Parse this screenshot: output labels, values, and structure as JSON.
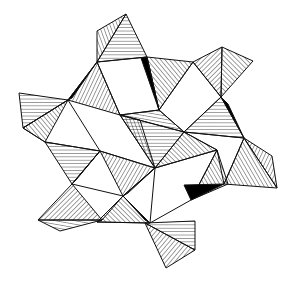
{
  "diagram": {
    "type": "polyhedral-structure",
    "description": "Ring of hatched tetrahedra linked by corners around open square gaps",
    "colors": {
      "line": "#111111",
      "background": "#ffffff",
      "shadow": "#000000"
    },
    "polyhedra": [
      {
        "id": "t1",
        "faces": [
          {
            "pts": [
              [
                126,
                14
              ],
              [
                97,
                31
              ],
              [
                97,
                62
              ]
            ],
            "hatch": 70
          },
          {
            "pts": [
              [
                126,
                14
              ],
              [
                97,
                62
              ],
              [
                147,
                57
              ]
            ],
            "hatch": 0
          }
        ]
      },
      {
        "id": "t2",
        "faces": [
          {
            "pts": [
              [
                222,
                47
              ],
              [
                193,
                62
              ],
              [
                221,
                97
              ]
            ],
            "hatch": 135
          },
          {
            "pts": [
              [
                222,
                47
              ],
              [
                253,
                61
              ],
              [
                221,
                97
              ]
            ],
            "hatch": 45
          }
        ]
      },
      {
        "id": "t3",
        "faces": [
          {
            "pts": [
              [
                141,
                58
              ],
              [
                147,
                57
              ],
              [
                159,
                110
              ]
            ],
            "hatch": 0,
            "fill": "#000"
          },
          {
            "pts": [
              [
                147,
                57
              ],
              [
                193,
                62
              ],
              [
                159,
                110
              ]
            ],
            "hatch": 50
          }
        ]
      },
      {
        "id": "t4",
        "faces": [
          {
            "pts": [
              [
                97,
                62
              ],
              [
                68,
                100
              ],
              [
                120,
                115
              ]
            ],
            "hatch": 115
          },
          {
            "pts": [
              [
                97,
                62
              ],
              [
                72,
                98
              ],
              [
                68,
                100
              ]
            ],
            "hatch": 0,
            "fill": "#000"
          }
        ]
      },
      {
        "id": "t5",
        "faces": [
          {
            "pts": [
              [
                19,
                93
              ],
              [
                68,
                100
              ],
              [
                23,
                128
              ]
            ],
            "hatch": 0
          },
          {
            "pts": [
              [
                68,
                100
              ],
              [
                23,
                128
              ],
              [
                45,
                142
              ]
            ],
            "hatch": 50
          }
        ]
      },
      {
        "id": "t6",
        "faces": [
          {
            "pts": [
              [
                221,
                97
              ],
              [
                184,
                132
              ],
              [
                244,
                138
              ]
            ],
            "hatch": 0
          },
          {
            "pts": [
              [
                221,
                97
              ],
              [
                228,
                104
              ],
              [
                244,
                138
              ]
            ],
            "hatch": 0,
            "fill": "#000"
          }
        ]
      },
      {
        "id": "t7",
        "faces": [
          {
            "pts": [
              [
                244,
                138
              ],
              [
                272,
                156
              ],
              [
                277,
                188
              ]
            ],
            "hatch": 115
          },
          {
            "pts": [
              [
                244,
                138
              ],
              [
                224,
                184
              ],
              [
                277,
                188
              ]
            ],
            "hatch": 60
          }
        ]
      },
      {
        "id": "t8",
        "faces": [
          {
            "pts": [
              [
                120,
                115
              ],
              [
                184,
                132
              ],
              [
                159,
                110
              ]
            ],
            "hatch": 10
          },
          {
            "pts": [
              [
                120,
                115
              ],
              [
                155,
                168
              ],
              [
                184,
                132
              ]
            ],
            "hatch": 0
          },
          {
            "pts": [
              [
                120,
                115
              ],
              [
                155,
                168
              ],
              [
                140,
                120
              ]
            ],
            "hatch": 70
          }
        ]
      },
      {
        "id": "t9",
        "faces": [
          {
            "pts": [
              [
                184,
                132
              ],
              [
                155,
                168
              ],
              [
                217,
                150
              ]
            ],
            "hatch": 45
          }
        ]
      },
      {
        "id": "t10",
        "faces": [
          {
            "pts": [
              [
                45,
                142
              ],
              [
                100,
                151
              ],
              [
                72,
                184
              ]
            ],
            "hatch": 0
          },
          {
            "pts": [
              [
                100,
                151
              ],
              [
                72,
                184
              ],
              [
                76,
                180
              ]
            ],
            "hatch": 0,
            "fill": "#000"
          }
        ]
      },
      {
        "id": "t11",
        "faces": [
          {
            "pts": [
              [
                72,
                184
              ],
              [
                38,
                220
              ],
              [
                102,
                220
              ]
            ],
            "hatch": 135
          },
          {
            "pts": [
              [
                38,
                220
              ],
              [
                102,
                220
              ],
              [
                60,
                231
              ]
            ],
            "hatch": 10
          }
        ]
      },
      {
        "id": "t12",
        "faces": [
          {
            "pts": [
              [
                100,
                151
              ],
              [
                155,
                168
              ],
              [
                123,
                196
              ]
            ],
            "hatch": 120
          },
          {
            "pts": [
              [
                155,
                168
              ],
              [
                123,
                196
              ],
              [
                128,
                193
              ]
            ],
            "hatch": 0
          }
        ]
      },
      {
        "id": "t13",
        "faces": [
          {
            "pts": [
              [
                123,
                196
              ],
              [
                97,
                222
              ],
              [
                150,
                223
              ]
            ],
            "hatch": 45
          },
          {
            "pts": [
              [
                123,
                196
              ],
              [
                145,
                220
              ],
              [
                150,
                223
              ]
            ],
            "hatch": 0,
            "fill": "#000"
          }
        ]
      },
      {
        "id": "t14",
        "faces": [
          {
            "pts": [
              [
                217,
                150
              ],
              [
                228,
                184
              ],
              [
                191,
                200
              ]
            ],
            "hatch": 60
          },
          {
            "pts": [
              [
                224,
                184
              ],
              [
                191,
                200
              ],
              [
                184,
                185
              ]
            ],
            "hatch": 0,
            "fill": "#000"
          }
        ]
      },
      {
        "id": "t15",
        "faces": [
          {
            "pts": [
              [
                145,
                223
              ],
              [
                195,
                221
              ],
              [
                195,
                250
              ]
            ],
            "hatch": 0
          },
          {
            "pts": [
              [
                145,
                223
              ],
              [
                195,
                250
              ],
              [
                166,
                268
              ]
            ],
            "hatch": 130
          }
        ]
      }
    ],
    "square_gaps": [
      [
        [
          97,
          62
        ],
        [
          147,
          57
        ],
        [
          159,
          110
        ],
        [
          120,
          115
        ]
      ],
      [
        [
          159,
          110
        ],
        [
          193,
          62
        ],
        [
          221,
          97
        ],
        [
          184,
          132
        ]
      ],
      [
        [
          23,
          128
        ],
        [
          45,
          142
        ],
        [
          100,
          151
        ],
        [
          68,
          100
        ]
      ],
      [
        [
          184,
          132
        ],
        [
          244,
          138
        ],
        [
          224,
          184
        ],
        [
          217,
          150
        ]
      ],
      [
        [
          100,
          151
        ],
        [
          155,
          168
        ],
        [
          123,
          196
        ],
        [
          72,
          184
        ]
      ],
      [
        [
          155,
          168
        ],
        [
          217,
          150
        ],
        [
          191,
          200
        ],
        [
          150,
          223
        ]
      ],
      [
        [
          102,
          220
        ],
        [
          123,
          196
        ],
        [
          150,
          223
        ],
        [
          97,
          222
        ]
      ]
    ]
  }
}
